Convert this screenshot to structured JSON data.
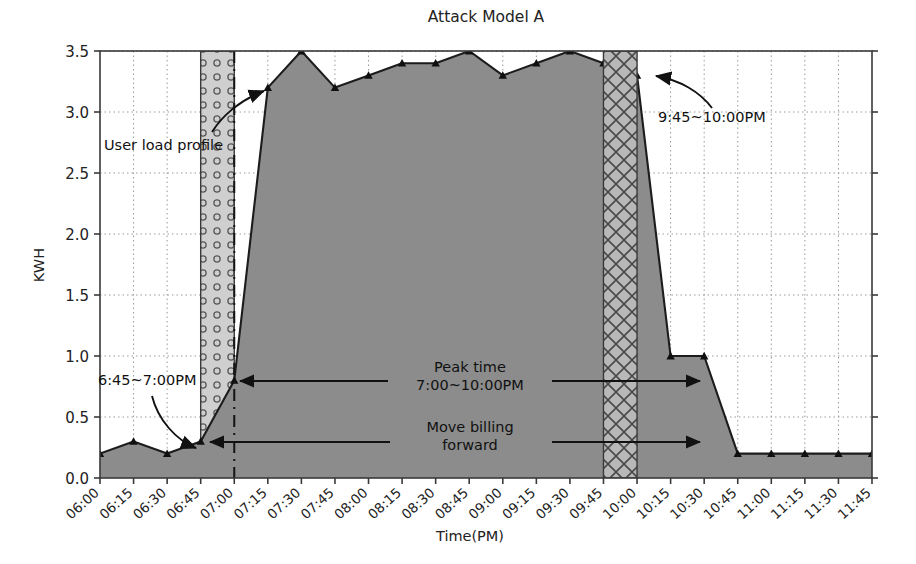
{
  "chart_data": {
    "type": "area",
    "title": "Attack Model A",
    "xlabel": "Time(PM)",
    "ylabel": "KWH",
    "grid": true,
    "legend": "none",
    "ylim": [
      0.0,
      3.5
    ],
    "yticks": [
      "0.0",
      "0.5",
      "1.0",
      "1.5",
      "2.0",
      "2.5",
      "3.0",
      "3.5"
    ],
    "ytick_values": [
      0.0,
      0.5,
      1.0,
      1.5,
      2.0,
      2.5,
      3.0,
      3.5
    ],
    "categories": [
      "06:00",
      "06:15",
      "06:30",
      "06:45",
      "07:00",
      "07:15",
      "07:30",
      "07:45",
      "08:00",
      "08:15",
      "08:30",
      "08:45",
      "09:00",
      "09:15",
      "09:30",
      "09:45",
      "10:00",
      "10:15",
      "10:30",
      "10:45",
      "11:00",
      "11:15",
      "11:30",
      "11:45"
    ],
    "series": [
      {
        "name": "User load profile",
        "values": [
          0.2,
          0.3,
          0.2,
          0.3,
          0.8,
          3.2,
          3.5,
          3.2,
          3.3,
          3.4,
          3.4,
          3.5,
          3.3,
          3.4,
          3.5,
          3.4,
          3.3,
          1.0,
          1.0,
          0.2,
          0.2,
          0.2,
          0.2,
          0.2
        ]
      }
    ],
    "annotations": [
      {
        "id": "user-load-profile",
        "text": "User load profile",
        "target_category": "07:15",
        "target_value": 3.2
      },
      {
        "id": "shift-window",
        "text": "6:45~7:00PM",
        "target_category": "06:45",
        "target_value": 0.3
      },
      {
        "id": "peak-time",
        "text": "Peak time",
        "text2": "7:00~10:00PM",
        "from_category": "07:00",
        "to_category": "10:00",
        "value": 0.8
      },
      {
        "id": "move-billing",
        "text": "Move billing",
        "text2": "forward",
        "from_category": "07:00",
        "to_category": "10:00",
        "value": 0.3
      },
      {
        "id": "late-window",
        "text": "9:45~10:00PM",
        "target_category": "10:00",
        "target_value": 3.3
      }
    ],
    "highlight_regions": [
      {
        "id": "dotted-region",
        "from_category": "06:45",
        "to_category": "07:00",
        "pattern": "dots"
      },
      {
        "id": "crosshatch-region",
        "from_category": "09:45",
        "to_category": "10:00",
        "pattern": "crosshatch"
      }
    ],
    "vertical_markers": [
      {
        "id": "dashdot-divider",
        "at_category": "07:00",
        "style": "dashdot"
      }
    ],
    "colors": {
      "area_fill": "#8c8c8c",
      "line": "#1c1c1c",
      "axis": "#3a3a3a",
      "grid": "#9a9a9a",
      "text": "#1a1a1a",
      "dotted_fill": "#c9c9c9",
      "crosshatch_fill": "#b4b4b4"
    }
  }
}
